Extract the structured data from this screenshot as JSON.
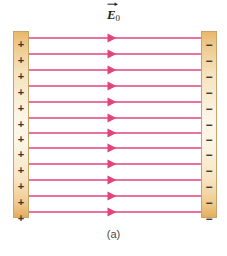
{
  "figure": {
    "caption": "(a)",
    "background_color": "#ffffff",
    "field_label": {
      "symbol": "E",
      "subscript": "0",
      "accent": "vector-arrow",
      "full_text": "E⃗₀",
      "color": "#231f20"
    },
    "plates": {
      "positive": {
        "name": "positive-plate",
        "charge_symbol": "+",
        "charge_count": 12,
        "fill_color": "#f6e2bc",
        "edge_color": "#e8b86a",
        "border_color": "#c9a36a",
        "x": 13,
        "width": 16,
        "top": 31,
        "height": 187,
        "signs": [
          "+",
          "+",
          "+",
          "+",
          "+",
          "+",
          "+",
          "+",
          "+",
          "+",
          "+",
          "+"
        ]
      },
      "negative": {
        "name": "negative-plate",
        "charge_symbol": "−",
        "charge_count": 12,
        "fill_color": "#f6e2bc",
        "edge_color": "#e8b86a",
        "border_color": "#c9a36a",
        "x": 201,
        "width": 16,
        "top": 31,
        "height": 187,
        "signs": [
          "−",
          "−",
          "−",
          "−",
          "−",
          "−",
          "−",
          "−",
          "−",
          "−",
          "−",
          "−"
        ]
      }
    },
    "field": {
      "line_count": 12,
      "line_color": "#e0457b",
      "line_width": 1.6,
      "direction": "left-to-right",
      "arrow_center_x": 112,
      "x_start": 29,
      "x_end": 201,
      "y_positions": [
        38,
        54,
        70,
        86,
        102,
        118,
        133,
        148,
        164,
        180,
        196,
        212
      ]
    }
  },
  "chart_data": {
    "type": "diagram",
    "label": "E⃗₀",
    "caption": "(a)",
    "field_line_count": 12,
    "field_direction_degrees": 0,
    "positive_charge_count": 12,
    "negative_charge_count": 12
  }
}
